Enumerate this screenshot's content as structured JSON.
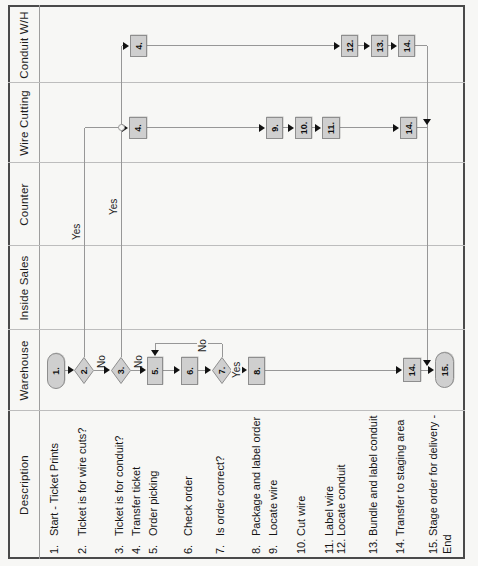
{
  "colors": {
    "paper": "#f7f7f5",
    "outer_border": "#4a4a4a",
    "lane_line": "#bdbdbd",
    "flow_line": "#979797",
    "shape_fill": "#cfcfcf",
    "shape_stroke": "#8e8e8e",
    "text": "#151515"
  },
  "orientation_note": "scanned chart rotated 90deg CCW",
  "lanes": [
    {
      "id": "description",
      "label": "Description",
      "x0": 7,
      "x1": 155
    },
    {
      "id": "warehouse",
      "label": "Warehouse",
      "x0": 155,
      "x1": 236
    },
    {
      "id": "inside_sales",
      "label": "Inside Sales",
      "x0": 236,
      "x1": 320
    },
    {
      "id": "counter",
      "label": "Counter",
      "x0": 320,
      "x1": 403
    },
    {
      "id": "wire_cutting",
      "label": "Wire Cutting",
      "x0": 403,
      "x1": 483
    },
    {
      "id": "conduit_wh",
      "label": "Conduit W/H",
      "x0": 483,
      "x1": 559
    }
  ],
  "description_items": [
    {
      "num": "1.",
      "text": "Start - Ticket Prints",
      "y": 54
    },
    {
      "num": "2.",
      "text": "Ticket is for wire cuts?",
      "y": 82
    },
    {
      "num": "3.",
      "text": "Ticket is for conduit?",
      "y": 119
    },
    {
      "num": "4.",
      "text": "Transfer ticket",
      "y": 136
    },
    {
      "num": "5.",
      "text": "Order picking",
      "y": 153
    },
    {
      "num": "6.",
      "text": "Check order",
      "y": 188
    },
    {
      "num": "7.",
      "text": "Is order correct?",
      "y": 220
    },
    {
      "num": "8.",
      "text": "Package and label order",
      "y": 256
    },
    {
      "num": "9.",
      "text": "Locate wire",
      "y": 273
    },
    {
      "num": "10.",
      "text": "Cut wire",
      "y": 301
    },
    {
      "num": "11.",
      "text": "Label wire",
      "y": 329
    },
    {
      "num": "12.",
      "text": "Locate conduit",
      "y": 341
    },
    {
      "num": "13.",
      "text": "Bundle and label conduit",
      "y": 373
    },
    {
      "num": "14.",
      "text": "Transfer to staging area",
      "y": 400
    },
    {
      "num": "15.",
      "text": "Stage order for delivery -",
      "text2": "End",
      "y": 433,
      "y2": 447
    }
  ],
  "shapes": [
    {
      "step": "1",
      "lane": "warehouse",
      "type": "stadium",
      "label": "1.",
      "x": 177,
      "y": 47,
      "w": 36,
      "h": 18
    },
    {
      "step": "2",
      "lane": "warehouse",
      "type": "diamond",
      "label": "2.",
      "x": 182,
      "y": 74,
      "w": 27,
      "h": 20
    },
    {
      "step": "3",
      "lane": "warehouse",
      "type": "diamond",
      "label": "3.",
      "x": 182,
      "y": 111,
      "w": 27,
      "h": 20
    },
    {
      "step": "5",
      "lane": "warehouse",
      "type": "rect",
      "label": "5.",
      "x": 181,
      "y": 147,
      "w": 28,
      "h": 16
    },
    {
      "step": "6",
      "lane": "warehouse",
      "type": "rect",
      "label": "6.",
      "x": 181,
      "y": 181,
      "w": 28,
      "h": 17
    },
    {
      "step": "7",
      "lane": "warehouse",
      "type": "diamond",
      "label": "7.",
      "x": 182,
      "y": 212,
      "w": 27,
      "h": 20
    },
    {
      "step": "8",
      "lane": "warehouse",
      "type": "rect",
      "label": "8.",
      "x": 181,
      "y": 248,
      "w": 28,
      "h": 17
    },
    {
      "step": "14",
      "lane": "warehouse",
      "type": "rect",
      "label": "14.",
      "x": 184,
      "y": 403,
      "w": 24,
      "h": 18
    },
    {
      "step": "15",
      "lane": "warehouse",
      "type": "stadium",
      "label": "15.",
      "x": 178,
      "y": 435,
      "w": 36,
      "h": 19
    },
    {
      "step": "4",
      "lane": "wire_cutting",
      "type": "rect",
      "label": "4.",
      "x": 427,
      "y": 129,
      "w": 22,
      "h": 18
    },
    {
      "step": "9",
      "lane": "wire_cutting",
      "type": "rect",
      "label": "9.",
      "x": 427,
      "y": 266,
      "w": 22,
      "h": 17
    },
    {
      "step": "10",
      "lane": "wire_cutting",
      "type": "rect",
      "label": "10.",
      "x": 427,
      "y": 295,
      "w": 22,
      "h": 17
    },
    {
      "step": "11",
      "lane": "wire_cutting",
      "type": "rect",
      "label": "11.",
      "x": 427,
      "y": 322,
      "w": 22,
      "h": 18
    },
    {
      "step": "14",
      "lane": "wire_cutting",
      "type": "rect",
      "label": "14.",
      "x": 427,
      "y": 400,
      "w": 22,
      "h": 17
    },
    {
      "step": "4",
      "lane": "conduit_wh",
      "type": "rect",
      "label": "4.",
      "x": 509,
      "y": 130,
      "w": 22,
      "h": 17
    },
    {
      "step": "12",
      "lane": "conduit_wh",
      "type": "rect",
      "label": "12.",
      "x": 509,
      "y": 341,
      "w": 22,
      "h": 17
    },
    {
      "step": "13",
      "lane": "conduit_wh",
      "type": "rect",
      "label": "13.",
      "x": 509,
      "y": 371,
      "w": 22,
      "h": 17
    },
    {
      "step": "14",
      "lane": "conduit_wh",
      "type": "rect",
      "label": "14.",
      "x": 509,
      "y": 398,
      "w": 22,
      "h": 17
    }
  ],
  "lines": [
    {
      "o": "v",
      "x": 195,
      "y": 65,
      "len": 4
    },
    {
      "o": "v",
      "x": 195,
      "y": 94,
      "len": 11
    },
    {
      "o": "v",
      "x": 195,
      "y": 131,
      "len": 10
    },
    {
      "o": "v",
      "x": 195,
      "y": 163,
      "len": 12
    },
    {
      "o": "v",
      "x": 195,
      "y": 198,
      "len": 8
    },
    {
      "o": "v",
      "x": 195,
      "y": 232,
      "len": 10
    },
    {
      "o": "v",
      "x": 195,
      "y": 265,
      "len": 132
    },
    {
      "o": "v",
      "x": 195,
      "y": 421,
      "len": 7
    },
    {
      "o": "h",
      "x": 209,
      "y": 222,
      "len": 13
    },
    {
      "o": "v",
      "x": 222,
      "y": 155,
      "len": 67
    },
    {
      "o": "h",
      "x": 216,
      "y": 155,
      "len": 6
    },
    {
      "o": "h",
      "x": 209,
      "y": 84,
      "len": 229
    },
    {
      "o": "v",
      "x": 438,
      "y": 85,
      "len": 38
    },
    {
      "o": "h",
      "x": 209,
      "y": 121,
      "len": 311
    },
    {
      "o": "v",
      "x": 520,
      "y": 122,
      "len": 4
    },
    {
      "o": "v",
      "x": 438,
      "y": 147,
      "len": 112
    },
    {
      "o": "v",
      "x": 438,
      "y": 283,
      "len": 6
    },
    {
      "o": "v",
      "x": 438,
      "y": 312,
      "len": 4
    },
    {
      "o": "v",
      "x": 438,
      "y": 340,
      "len": 53
    },
    {
      "o": "v",
      "x": 438,
      "y": 417,
      "len": 10
    },
    {
      "o": "v",
      "x": 520,
      "y": 147,
      "len": 187
    },
    {
      "o": "v",
      "x": 520,
      "y": 358,
      "len": 6
    },
    {
      "o": "v",
      "x": 520,
      "y": 388,
      "len": 3
    },
    {
      "o": "v",
      "x": 520,
      "y": 415,
      "len": 12
    },
    {
      "o": "h",
      "x": 201,
      "y": 427,
      "len": 319
    }
  ],
  "arrows": [
    {
      "dir": "down",
      "x": 196,
      "y": 74
    },
    {
      "dir": "down",
      "x": 196,
      "y": 110
    },
    {
      "dir": "down",
      "x": 196,
      "y": 146
    },
    {
      "dir": "down",
      "x": 196,
      "y": 180
    },
    {
      "dir": "down",
      "x": 196,
      "y": 211
    },
    {
      "dir": "down",
      "x": 196,
      "y": 247
    },
    {
      "dir": "down",
      "x": 196,
      "y": 402
    },
    {
      "dir": "down",
      "x": 196,
      "y": 434
    },
    {
      "dir": "left",
      "x": 210,
      "y": 155
    },
    {
      "dir": "down",
      "x": 438,
      "y": 128
    },
    {
      "dir": "down",
      "x": 520,
      "y": 129
    },
    {
      "dir": "down",
      "x": 438,
      "y": 265
    },
    {
      "dir": "down",
      "x": 438,
      "y": 294
    },
    {
      "dir": "down",
      "x": 438,
      "y": 321
    },
    {
      "dir": "down",
      "x": 438,
      "y": 399
    },
    {
      "dir": "down",
      "x": 520,
      "y": 340
    },
    {
      "dir": "down",
      "x": 520,
      "y": 370
    },
    {
      "dir": "down",
      "x": 520,
      "y": 397
    },
    {
      "dir": "left",
      "x": 441,
      "y": 427
    },
    {
      "dir": "left",
      "x": 200,
      "y": 427
    }
  ],
  "hops": [
    {
      "x": 438,
      "y": 121
    }
  ],
  "edge_labels": [
    {
      "text": "Yes",
      "x": 326,
      "y": 71,
      "knockout": false
    },
    {
      "text": "Yes",
      "x": 351,
      "y": 108,
      "knockout": false
    },
    {
      "text": "Yes",
      "x": 187,
      "y": 231,
      "knockout": true
    },
    {
      "text": "No",
      "x": 198,
      "y": 96,
      "knockout": false
    },
    {
      "text": "No",
      "x": 198,
      "y": 133,
      "knockout": false
    },
    {
      "text": "No",
      "x": 213,
      "y": 197,
      "knockout": true
    }
  ],
  "frame": {
    "left": 7,
    "top": 8,
    "width": 554,
    "height": 457,
    "header_y": 39
  }
}
